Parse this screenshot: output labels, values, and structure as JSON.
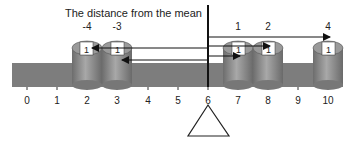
{
  "title": "The distance from the mean",
  "mean": 6,
  "axis": {
    "ticks": [
      "0",
      "1",
      "2",
      "3",
      "4",
      "5",
      "6",
      "7",
      "8",
      "9",
      "10"
    ]
  },
  "weights": [
    {
      "position": 2,
      "distance_label": "-4",
      "value": "1"
    },
    {
      "position": 3,
      "distance_label": "-3",
      "value": "1"
    },
    {
      "position": 7,
      "distance_label": "1",
      "value": "1"
    },
    {
      "position": 8,
      "distance_label": "2",
      "value": "1"
    },
    {
      "position": 10,
      "distance_label": "4",
      "value": "1"
    }
  ],
  "colors": {
    "beam": "#7a7a7a",
    "cylinder": "#8a8a8a",
    "line": "#111111"
  }
}
